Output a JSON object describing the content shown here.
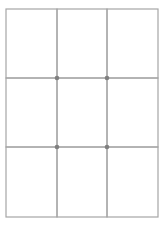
{
  "diagram": {
    "type": "grid",
    "rows": 3,
    "columns": 3,
    "cell_count": 9,
    "line_color": "#a6a6a6",
    "dot_color": "#808080",
    "junction_dots": [
      {
        "row_line": 1,
        "col_line": 1
      },
      {
        "row_line": 1,
        "col_line": 2
      },
      {
        "row_line": 2,
        "col_line": 1
      },
      {
        "row_line": 2,
        "col_line": 2
      }
    ]
  }
}
